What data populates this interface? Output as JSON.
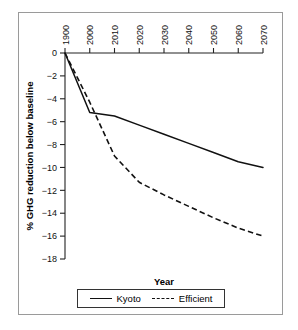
{
  "chart_data": {
    "type": "line",
    "title": "",
    "xlabel": "Year",
    "ylabel": "% GHG reduction below baseline",
    "xlim": [
      1900,
      2070
    ],
    "ylim": [
      -18,
      0
    ],
    "grid": false,
    "legend_position": "bottom-center",
    "xticks": [
      "1900",
      "2000",
      "2010",
      "2020",
      "2030",
      "2040",
      "2050",
      "2060",
      "2070"
    ],
    "xtick_values": [
      1900,
      2000,
      2010,
      2020,
      2030,
      2040,
      2050,
      2060,
      2070
    ],
    "yticks": [
      "0",
      "-2",
      "-4",
      "-6",
      "-8",
      "-10",
      "-12",
      "-14",
      "-16",
      "-18"
    ],
    "ytick_values": [
      0,
      -2,
      -4,
      -6,
      -8,
      -10,
      -12,
      -14,
      -16,
      -18
    ],
    "series": [
      {
        "name": "Kyoto",
        "style": "solid",
        "color": "#111111",
        "x": [
          1900,
          2000,
          2010,
          2020,
          2030,
          2040,
          2050,
          2060,
          2070
        ],
        "y": [
          0,
          -5.2,
          -5.5,
          -6.3,
          -7.1,
          -7.9,
          -8.7,
          -9.5,
          -10.0
        ]
      },
      {
        "name": "Efficient",
        "style": "dashed",
        "color": "#111111",
        "x": [
          1900,
          2000,
          2010,
          2020,
          2030,
          2040,
          2050,
          2060,
          2070
        ],
        "y": [
          0,
          -4.3,
          -9.0,
          -11.3,
          -12.4,
          -13.4,
          -14.4,
          -15.3,
          -16.0
        ]
      }
    ]
  },
  "axes": {
    "x_title": "Year",
    "y_title": "% GHG reduction below baseline"
  },
  "legend": {
    "items": [
      {
        "label": "Kyoto",
        "style": "solid"
      },
      {
        "label": "Efficient",
        "style": "dashed"
      }
    ]
  }
}
